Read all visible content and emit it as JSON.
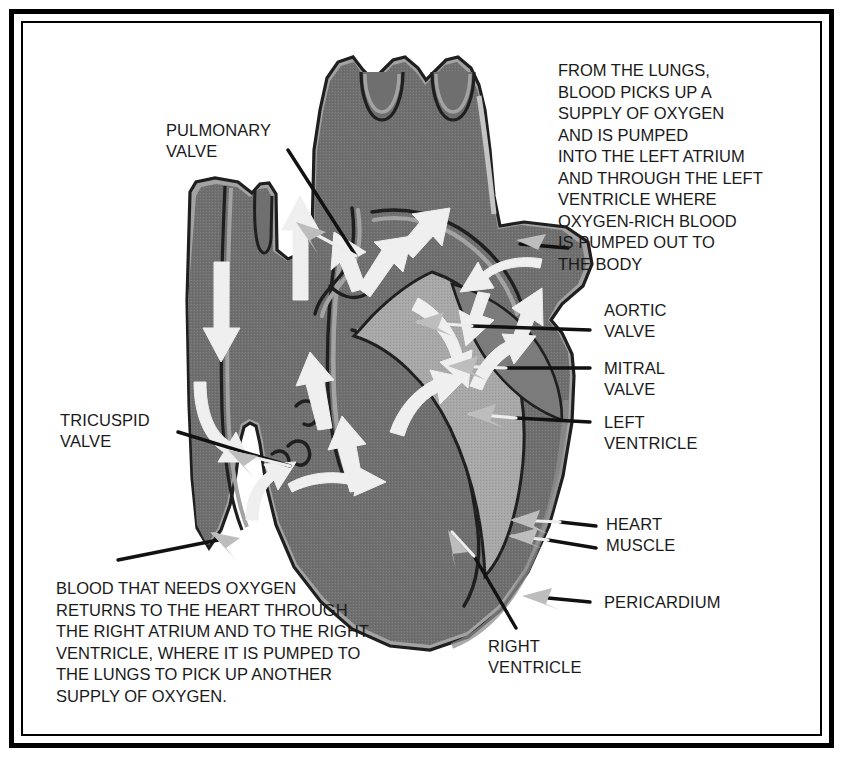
{
  "diagram": {
    "colors": {
      "muscle_dark": "#6f6f6f",
      "muscle_mid": "#7d7d7d",
      "muscle_light": "#9e9e9e",
      "outline": "#262626",
      "flow_arrow": "#f0f0f0",
      "pointer_arrow": "#b5b5b5",
      "leader_line": "#111111",
      "background": "#ffffff",
      "frame": "#000000"
    }
  },
  "paragraphs": {
    "lungs_text": "FROM THE LUNGS,\nBLOOD PICKS UP A\nSUPPLY OF OXYGEN\nAND IS PUMPED\nINTO THE LEFT ATRIUM\nAND THROUGH THE LEFT\nVENTRICLE WHERE\nOXYGEN-RICH BLOOD\nIS PUMPED OUT TO\nTHE BODY",
    "deoxygenated_text": "BLOOD THAT NEEDS OXYGEN\nRETURNS TO THE HEART THROUGH\nTHE RIGHT ATRIUM AND TO THE RIGHT\nVENTRICLE, WHERE IT IS PUMPED TO\nTHE LUNGS TO PICK UP ANOTHER\nSUPPLY OF OXYGEN."
  },
  "labels": {
    "pulmonary_valve": "PULMONARY\nVALVE",
    "tricuspid_valve": "TRICUSPID\nVALVE",
    "aortic_valve": "AORTIC\nVALVE",
    "mitral_valve": "MITRAL\nVALVE",
    "left_ventricle": "LEFT\nVENTRICLE",
    "heart_muscle": "HEART\nMUSCLE",
    "pericardium": "PERICARDIUM",
    "right_ventricle": "RIGHT\nVENTRICLE"
  }
}
